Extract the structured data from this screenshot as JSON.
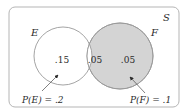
{
  "diagram": {
    "type": "venn",
    "universe_label": "S",
    "sets": [
      {
        "name": "E",
        "shaded": false,
        "probability_label": "P(E) = .2"
      },
      {
        "name": "F",
        "shaded": true,
        "probability_label": "P(F) = .1"
      }
    ],
    "regions": {
      "E_only": ".15",
      "E_and_F": ".05",
      "F_only": ".05"
    },
    "colors": {
      "border": "#b5b5b5",
      "circle_stroke": "#9a9a9a",
      "shade": "#d4d4d4",
      "text": "#2b2b2b"
    }
  }
}
